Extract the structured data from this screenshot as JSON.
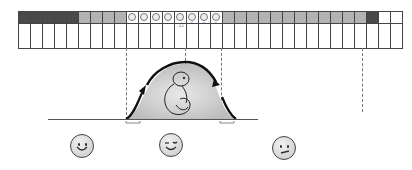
{
  "diagram": {
    "cycle_days": 32,
    "day_types": [
      "dark",
      "dark",
      "dark",
      "dark",
      "dark",
      "grey",
      "grey",
      "grey",
      "grey",
      "fertile",
      "fertile",
      "fertile",
      "fertile",
      "fertile",
      "fertile",
      "fertile",
      "fertile",
      "grey",
      "grey",
      "grey",
      "grey",
      "grey",
      "grey",
      "grey",
      "grey",
      "grey",
      "grey",
      "grey",
      "grey",
      "dark",
      "white",
      "white"
    ],
    "legend": {
      "dark": "Menstruation",
      "grey": "Non-fertile day",
      "fertile": "Fertile window",
      "white": "Next cycle"
    },
    "markers": {
      "ovulation_day_index": 13,
      "sperm_marker_day_indices": [
        14,
        15,
        16
      ]
    },
    "colors": {
      "dark": "#4a4a4a",
      "grey": "#b3b3b3",
      "fertile": "#c8c8c8",
      "line": "#444444"
    },
    "curve": {
      "label": "Fertility curve",
      "icon": "fetus-icon"
    },
    "faces": [
      {
        "name": "happy-face-icon",
        "mood": "happy"
      },
      {
        "name": "wink-face-icon",
        "mood": "winking"
      },
      {
        "name": "sad-face-icon",
        "mood": "worried"
      }
    ]
  }
}
